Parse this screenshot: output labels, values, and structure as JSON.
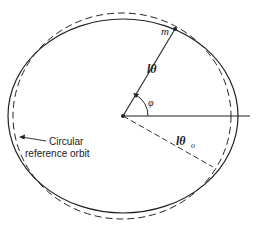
{
  "diagram": {
    "title": "",
    "labels": {
      "mass": "m",
      "radius": "lθ",
      "angle": "φ",
      "reference_radius": "lθ",
      "reference_radius_subscript": "o",
      "reference_orbit_line1": "Circular",
      "reference_orbit_line2": "reference orbit"
    },
    "elements": {
      "actual_orbit": "solid ellipse",
      "reference_orbit": "dashed circle",
      "center": "focus point",
      "horizontal_axis": "reference line"
    },
    "colors": {
      "ink": "#222222",
      "background": "#ffffff"
    }
  }
}
